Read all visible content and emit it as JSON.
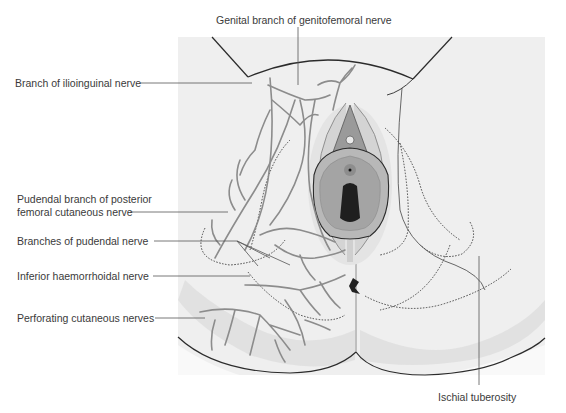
{
  "figure": {
    "type": "anatomical-illustration"
  },
  "labels": {
    "genital_branch": "Genital branch of genitofemoral nerve",
    "ilioinguinal": "Branch of ilioinguinal nerve",
    "pudendal_posterior_line1": "Pudendal branch of posterior",
    "pudendal_posterior_line2": "femoral cutaneous nerve",
    "pudendal_branches": "Branches of pudendal nerve",
    "inferior_haemorrhoidal": "Inferior haemorrhoidal nerve",
    "perforating": "Perforating cutaneous nerves",
    "ischial_tuberosity": "Ischial tuberosity"
  },
  "colors": {
    "panel_bg": "#efefef",
    "skin_shadow": "#e2e2e2",
    "outline": "#2b2b2b",
    "nerve": "#8c8c8c",
    "leader": "#555555",
    "text": "#3a3a3a"
  }
}
